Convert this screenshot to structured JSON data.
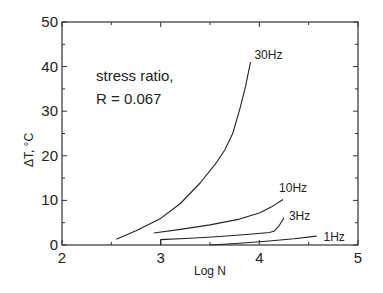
{
  "chart_data": {
    "type": "line",
    "title": "",
    "xlabel": "Log N",
    "ylabel": "ΔT, °C",
    "xlim": [
      2,
      5
    ],
    "ylim": [
      0,
      50
    ],
    "xticks": [
      2,
      3,
      4,
      5
    ],
    "yticks": [
      0,
      10,
      20,
      30,
      40,
      50
    ],
    "x_minor_step": 0.5,
    "y_minor_step": 5,
    "grid": false,
    "legend": "inline labels at curve ends",
    "annotation": [
      "stress ratio,",
      "R = 0.067"
    ],
    "series": [
      {
        "name": "30Hz",
        "x": [
          2.55,
          2.75,
          2.99,
          3.2,
          3.4,
          3.55,
          3.65,
          3.73,
          3.8,
          3.86,
          3.91
        ],
        "y": [
          1.3,
          3.2,
          5.8,
          9.3,
          13.9,
          18.0,
          21.3,
          25.0,
          30.3,
          35.5,
          41.0
        ]
      },
      {
        "name": "10Hz",
        "x": [
          2.93,
          3.2,
          3.5,
          3.8,
          4.0,
          4.12,
          4.24
        ],
        "y": [
          2.7,
          3.5,
          4.5,
          5.8,
          7.2,
          8.5,
          10.2
        ]
      },
      {
        "name": "3Hz",
        "x": [
          3.0,
          3.0,
          3.3,
          3.6,
          3.9,
          4.1,
          4.15,
          4.2,
          4.25
        ],
        "y": [
          0.0,
          1.2,
          1.5,
          1.9,
          2.4,
          2.8,
          3.1,
          4.3,
          6.1
        ]
      },
      {
        "name": "1Hz",
        "x": [
          3.5,
          3.8,
          4.1,
          4.35,
          4.58
        ],
        "y": [
          0.0,
          0.4,
          0.9,
          1.4,
          2.0
        ]
      }
    ],
    "labels": [
      {
        "text": "30Hz",
        "x": 3.95,
        "y": 42.5
      },
      {
        "text": "10Hz",
        "x": 4.2,
        "y": 12.8
      },
      {
        "text": "3Hz",
        "x": 4.3,
        "y": 6.5
      },
      {
        "text": "1Hz",
        "x": 4.65,
        "y": 1.8
      }
    ]
  }
}
